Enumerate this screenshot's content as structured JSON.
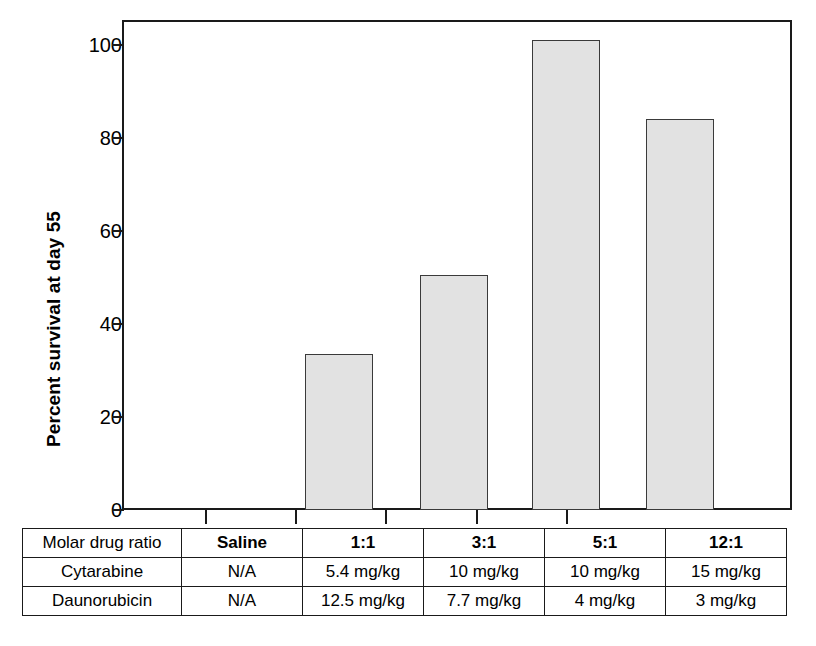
{
  "chart_data": {
    "type": "bar",
    "title": "",
    "xlabel": "",
    "ylabel": "Percent survival at day 55",
    "ylim": [
      0,
      110
    ],
    "yticks": [
      0,
      20,
      40,
      60,
      80,
      100
    ],
    "ytick_labels": [
      "0",
      "20",
      "40",
      "60",
      "80",
      "100"
    ],
    "grid": false,
    "legend": "none",
    "bar_fill_color": "#e2e2e2",
    "bar_edge_color": "#3a3a3a",
    "categories": [
      "Saline",
      "1:1",
      "3:1",
      "5:1",
      "12:1"
    ],
    "values": [
      0,
      33.5,
      50.5,
      101,
      84
    ],
    "series": [
      {
        "name": "Percent survival at day 55",
        "values": [
          0,
          33.5,
          50.5,
          101,
          84
        ]
      }
    ]
  },
  "axis": {
    "y_title": "Percent survival at day 55",
    "y_ticks": [
      {
        "label": "100",
        "value": 100
      },
      {
        "label": "80",
        "value": 80
      },
      {
        "label": "60",
        "value": 60
      },
      {
        "label": "40",
        "value": 40
      },
      {
        "label": "20",
        "value": 20
      },
      {
        "label": "0",
        "value": 0
      }
    ]
  },
  "table": {
    "rows": [
      {
        "header": true,
        "label": "Molar drug ratio",
        "cells": [
          "Saline",
          "1:1",
          "3:1",
          "5:1",
          "12:1"
        ]
      },
      {
        "header": false,
        "label": "Cytarabine",
        "cells": [
          "N/A",
          "5.4 mg/kg",
          "10 mg/kg",
          "10 mg/kg",
          "15 mg/kg"
        ]
      },
      {
        "header": false,
        "label": "Daunorubicin",
        "cells": [
          "N/A",
          "12.5 mg/kg",
          "7.7 mg/kg",
          "4 mg/kg",
          "3 mg/kg"
        ]
      }
    ]
  }
}
